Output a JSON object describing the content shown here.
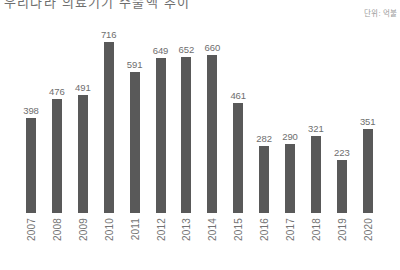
{
  "header": {
    "title_clipped": "우리나라 의료기기 수출액 추이",
    "unit_note": "단위: 억불"
  },
  "colors": {
    "bar": "#595959",
    "value_label": "#6e6e6e",
    "axis_label": "#737373",
    "unit_label": "#9a9a9a",
    "background": "#ffffff"
  },
  "chart_data": {
    "type": "bar",
    "title": "우리나라 의료기기 수출액 추이",
    "xlabel": "",
    "ylabel": "",
    "unit": "단위: 억불",
    "ylim": [
      0,
      760
    ],
    "grid": false,
    "legend": "none",
    "orientation": "vertical",
    "value_labels": true,
    "xtick_rotation": 90,
    "categories": [
      "2007",
      "2008",
      "2009",
      "2010",
      "2011",
      "2012",
      "2013",
      "2014",
      "2015",
      "2016",
      "2017",
      "2018",
      "2019",
      "2020"
    ],
    "values": [
      398,
      476,
      491,
      716,
      591,
      649,
      652,
      660,
      461,
      282,
      290,
      321,
      223,
      351
    ],
    "points": [
      {
        "category": "2007",
        "value": 398,
        "label": "398"
      },
      {
        "category": "2008",
        "value": 476,
        "label": "476"
      },
      {
        "category": "2009",
        "value": 491,
        "label": "491"
      },
      {
        "category": "2010",
        "value": 716,
        "label": "716"
      },
      {
        "category": "2011",
        "value": 591,
        "label": "591"
      },
      {
        "category": "2012",
        "value": 649,
        "label": "649"
      },
      {
        "category": "2013",
        "value": 652,
        "label": "652"
      },
      {
        "category": "2014",
        "value": 660,
        "label": "660"
      },
      {
        "category": "2015",
        "value": 461,
        "label": "461"
      },
      {
        "category": "2016",
        "value": 282,
        "label": "282"
      },
      {
        "category": "2017",
        "value": 290,
        "label": "290"
      },
      {
        "category": "2018",
        "value": 321,
        "label": "321"
      },
      {
        "category": "2019",
        "value": 223,
        "label": "223"
      },
      {
        "category": "2020",
        "value": 351,
        "label": "351"
      }
    ]
  }
}
